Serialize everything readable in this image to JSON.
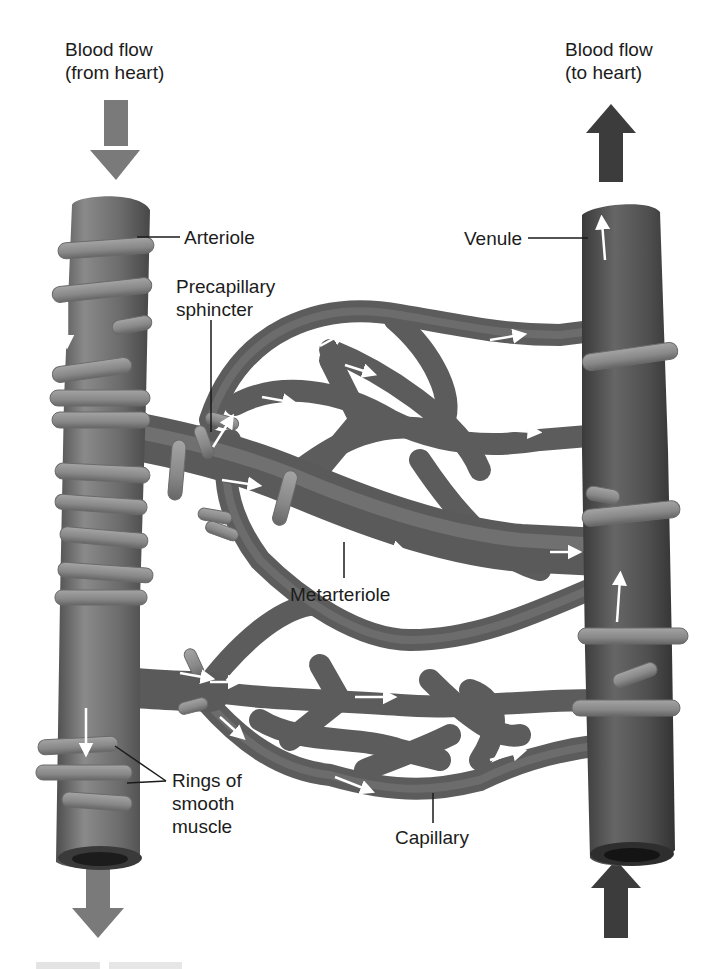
{
  "labels": {
    "flow_in": {
      "line1": "Blood flow",
      "line2": "(from heart)"
    },
    "flow_out": {
      "line1": "Blood flow",
      "line2": "(to heart)"
    },
    "arteriole": "Arteriole",
    "venule": "Venule",
    "precapillary": {
      "line1": "Precapillary",
      "line2": "sphincter"
    },
    "metarteriole": "Metarteriole",
    "rings": {
      "line1": "Rings of",
      "line2": "smooth",
      "line3": "muscle"
    },
    "capillary": "Capillary"
  },
  "icons": {
    "flow_in_top": "arrow-down-icon",
    "flow_out_top": "arrow-up-icon",
    "flow_in_bottom": "arrow-down-icon",
    "flow_out_bottom": "arrow-up-icon"
  },
  "colors": {
    "arteriole_arrow": "#7a7a7a",
    "venule_arrow": "#3c3c3c",
    "vessel_light": "#8a8a8a",
    "vessel_mid": "#6a6a6a",
    "vessel_dark": "#4a4a4a",
    "ring": "#8e8e8e",
    "flow_marker": "#ffffff"
  }
}
